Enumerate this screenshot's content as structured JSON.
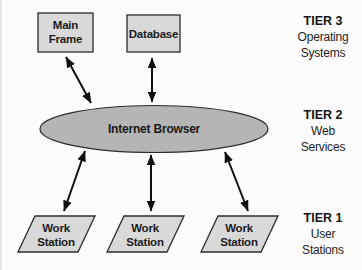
{
  "diagram": {
    "nodes": {
      "mainframe": {
        "line1": "Main",
        "line2": "Frame"
      },
      "database": {
        "label": "Database"
      },
      "browser": {
        "label": "Internet Browser"
      },
      "workstation1": {
        "line1": "Work",
        "line2": "Station"
      },
      "workstation2": {
        "line1": "Work",
        "line2": "Station"
      },
      "workstation3": {
        "line1": "Work",
        "line2": "Station"
      }
    },
    "tiers": {
      "tier3": {
        "title": "TIER 3",
        "line1": "Operating",
        "line2": "Systems"
      },
      "tier2": {
        "title": "TIER 2",
        "line1": "Web",
        "line2": "Services"
      },
      "tier1": {
        "title": "TIER 1",
        "line1": "User",
        "line2": "Stations"
      }
    },
    "connections": [
      {
        "from": "mainframe",
        "to": "browser",
        "style": "double-arrow"
      },
      {
        "from": "database",
        "to": "browser",
        "style": "double-arrow"
      },
      {
        "from": "browser",
        "to": "workstation1",
        "style": "double-arrow"
      },
      {
        "from": "browser",
        "to": "workstation2",
        "style": "double-arrow"
      },
      {
        "from": "browser",
        "to": "workstation3",
        "style": "double-arrow"
      }
    ],
    "colors": {
      "node_fill": "#d9d9d9",
      "ellipse_fill": "#b5b5b5",
      "stroke": "#2b2b2b",
      "arrow": "#101010",
      "background": "#fcfcfc"
    }
  }
}
